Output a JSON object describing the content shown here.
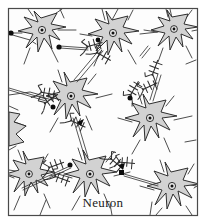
{
  "figure": {
    "caption": "Neuron",
    "frame": {
      "x": 8,
      "y": 8,
      "width": 190,
      "height": 208,
      "stroke_color": "#4a4a4a",
      "stroke_width": 1.2,
      "background_color": "#fdfdfd"
    },
    "style": {
      "soma_fill": "#d2d2d2",
      "soma_stroke": "#2e2e2e",
      "nucleus_ring_fill": "#e8e8e8",
      "nucleus_dot_fill": "#111111",
      "dendrite_stroke": "#3a3a3a",
      "axon_stroke": "#3a3a3a",
      "terminal_fill": "#0d0d0d",
      "synapse_stroke": "#2b2b2b",
      "caption_color": "#1b1b1b"
    },
    "counts": {
      "somas": 9,
      "axons": 6,
      "synaptic_terminals": 8,
      "synapse_clusters": 7
    },
    "labels": {
      "soma": "soma",
      "nucleus": "nucleus",
      "dendrite": "dendrite",
      "axon": "axon",
      "terminal_bouton": "terminal-bouton",
      "synapse_cluster": "synapse-cluster"
    }
  }
}
